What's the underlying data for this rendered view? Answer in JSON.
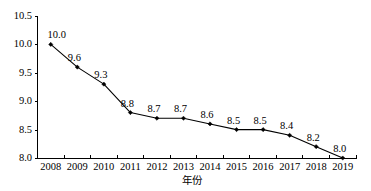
{
  "chart_data": {
    "type": "line",
    "title": "",
    "subtitle": "",
    "xlabel": "年份",
    "ylabel": "",
    "categories": [
      "2008",
      "2009",
      "2010",
      "2011",
      "2012",
      "2013",
      "2014",
      "2015",
      "2016",
      "2017",
      "2018",
      "2019"
    ],
    "values": [
      10.0,
      9.6,
      9.3,
      8.8,
      8.7,
      8.7,
      8.6,
      8.5,
      8.5,
      8.4,
      8.2,
      8.0
    ],
    "point_labels": [
      "10.0",
      "9.6",
      "9.3",
      "8.8",
      "8.7",
      "8.7",
      "8.6",
      "8.5",
      "8.5",
      "8.4",
      "8.2",
      "8.0"
    ],
    "ylim": [
      8.0,
      10.5
    ],
    "ytick_values": [
      8.0,
      8.5,
      9.0,
      9.5,
      10.0,
      10.5
    ],
    "ytick_labels": [
      "8.0",
      "8.5",
      "9.0",
      "9.5",
      "10.0",
      "10.5"
    ],
    "grid": false,
    "legend": false,
    "legend_position": "none",
    "series": [
      {
        "name": "",
        "values": [
          10.0,
          9.6,
          9.3,
          8.8,
          8.7,
          8.7,
          8.6,
          8.5,
          8.5,
          8.4,
          8.2,
          8.0
        ],
        "line_color": "#000000",
        "marker": "diamond",
        "marker_color": "#000000"
      }
    ]
  },
  "colors": {
    "background": "#ffffff",
    "axis": "#000000",
    "text": "#000000",
    "series": "#000000"
  }
}
